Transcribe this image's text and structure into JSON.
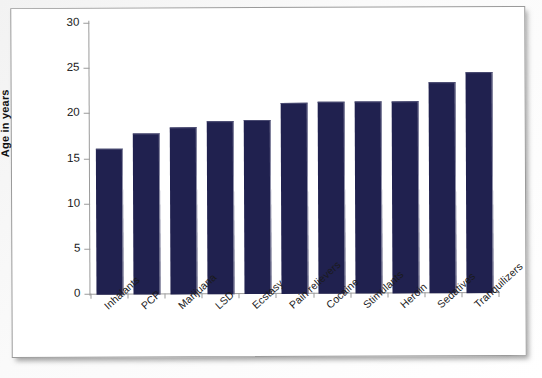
{
  "chart_data": {
    "type": "bar",
    "title": "",
    "xlabel": "",
    "ylabel": "Age in years",
    "ylim": [
      0,
      30
    ],
    "yticks": [
      0,
      5,
      10,
      15,
      20,
      25,
      30
    ],
    "grid": false,
    "legend": "none",
    "bar_color": "#20214f",
    "categories": [
      "Inhalants",
      "PCP",
      "Marijuana",
      "LSD",
      "Ecstasy",
      "Pain relievers",
      "Cocaine",
      "Stimulants",
      "Heroin",
      "Sedatives",
      "Tranquilizers"
    ],
    "values": [
      16.1,
      17.7,
      18.4,
      19.0,
      19.2,
      21.0,
      21.1,
      21.1,
      21.2,
      23.3,
      24.4
    ]
  },
  "axis": {
    "y_title": "Age in years",
    "tick_labels": [
      "30",
      "25",
      "20",
      "15",
      "10",
      "5",
      "0"
    ]
  }
}
